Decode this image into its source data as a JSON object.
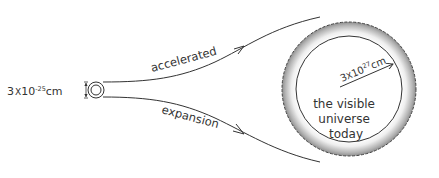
{
  "diagram": {
    "initial_size": {
      "mantissa": "3",
      "times": "X",
      "base": "10",
      "exponent": "-25",
      "unit": "cm"
    },
    "final_radius": {
      "mantissa": "3",
      "times": "X",
      "base": "10",
      "exponent": "27",
      "unit": "cm"
    },
    "upper_arrow_label": "accelerated",
    "lower_arrow_label": "expansion",
    "universe_label": {
      "line1": "the visible",
      "line2": "universe",
      "line3": "today"
    }
  },
  "colors": {
    "stroke": "#333333",
    "text": "#333333",
    "shell_light": "#f4f4f4",
    "shell_dark": "#9a9a9a",
    "background": "#ffffff"
  }
}
